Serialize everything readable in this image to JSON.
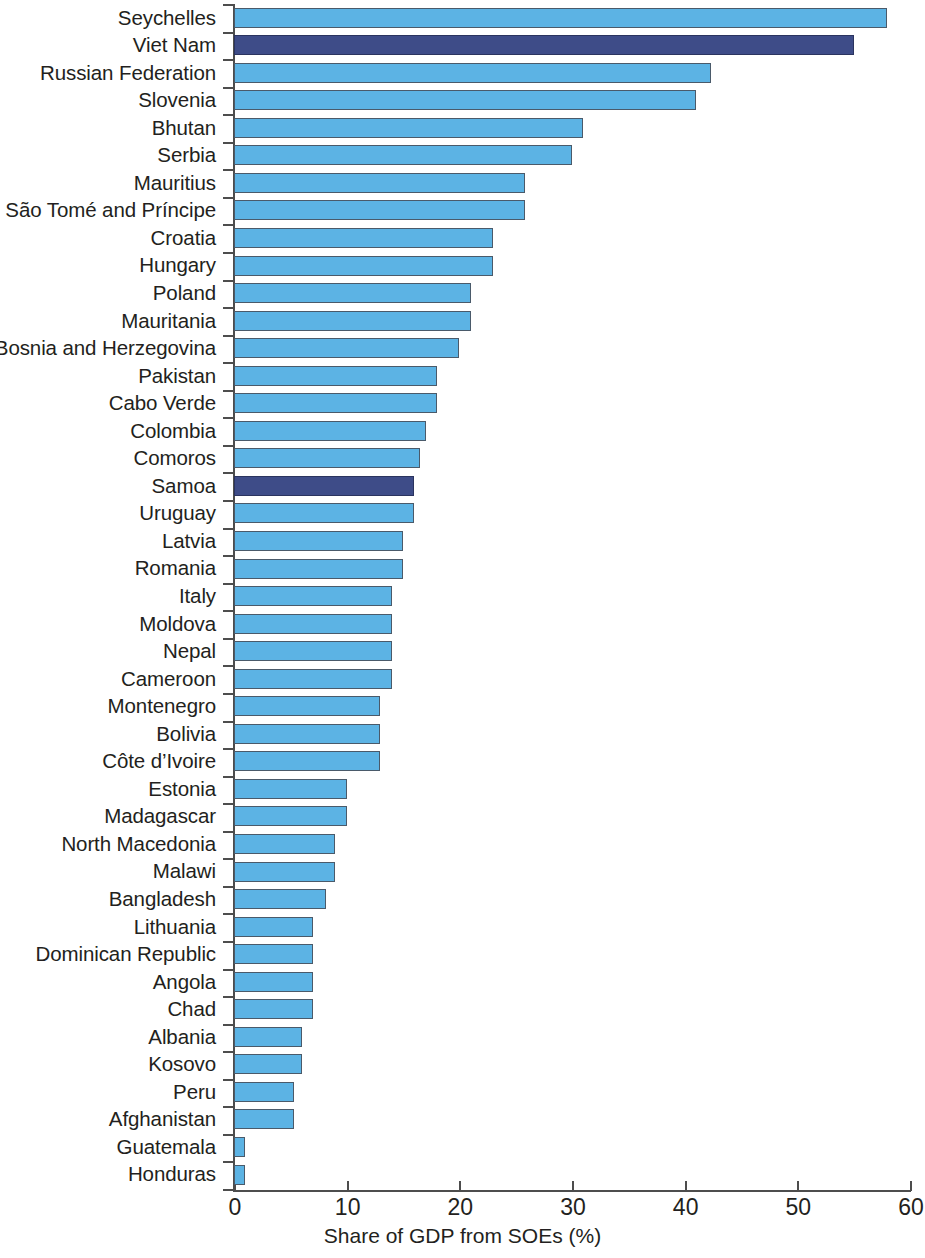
{
  "chart_data": {
    "type": "bar",
    "orientation": "horizontal",
    "title": "",
    "subtitle": "",
    "xlabel": "Share of GDP from SOEs (%)",
    "ylabel": "",
    "xlim": [
      0,
      60
    ],
    "xticks": [
      0,
      10,
      20,
      30,
      40,
      50,
      60
    ],
    "xtick_labels": [
      "0",
      "10",
      "20",
      "30",
      "40",
      "50",
      "60"
    ],
    "grid": false,
    "legend": null,
    "colors": {
      "bar": "#5cb3e4",
      "bar_highlight": "#3e4c88",
      "bar_border": "#4a5a6a",
      "axis": "#4d4d4d",
      "text": "#231f20",
      "background": "#ffffff"
    },
    "highlighted_categories": [
      "Viet Nam",
      "Samoa"
    ],
    "categories": [
      "Seychelles",
      "Viet Nam",
      "Russian Federation",
      "Slovenia",
      "Bhutan",
      "Serbia",
      "Mauritius",
      "São Tomé and Príncipe",
      "Croatia",
      "Hungary",
      "Poland",
      "Mauritania",
      "Bosnia and Herzegovina",
      "Pakistan",
      "Cabo Verde",
      "Colombia",
      "Comoros",
      "Samoa",
      "Uruguay",
      "Latvia",
      "Romania",
      "Italy",
      "Moldova",
      "Nepal",
      "Cameroon",
      "Montenegro",
      "Bolivia",
      "Côte d’Ivoire",
      "Estonia",
      "Madagascar",
      "North Macedonia",
      "Malawi",
      "Bangladesh",
      "Lithuania",
      "Dominican Republic",
      "Angola",
      "Chad",
      "Albania",
      "Kosovo",
      "Peru",
      "Afghanistan",
      "Guatemala",
      "Honduras"
    ],
    "values": [
      58.0,
      55.0,
      42.3,
      41.0,
      31.0,
      30.0,
      25.8,
      25.8,
      23.0,
      23.0,
      21.0,
      21.0,
      20.0,
      18.0,
      18.0,
      17.0,
      16.5,
      16.0,
      16.0,
      15.0,
      15.0,
      14.0,
      14.0,
      14.0,
      14.0,
      13.0,
      13.0,
      13.0,
      10.0,
      10.0,
      9.0,
      9.0,
      8.2,
      7.0,
      7.0,
      7.0,
      7.0,
      6.0,
      6.0,
      5.3,
      5.3,
      1.0,
      1.0
    ]
  }
}
